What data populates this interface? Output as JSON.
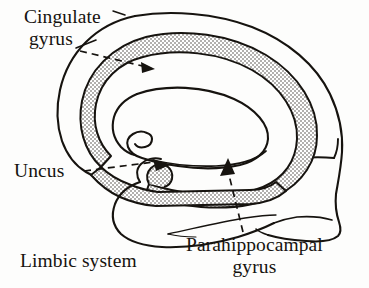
{
  "figure": {
    "title": "Limbic system",
    "background_color": "#fdfdfc",
    "ink_color": "#16130f",
    "stipple_color": "#4a4540"
  },
  "labels": {
    "cingulate": {
      "line1": "Cingulate",
      "line2": "gyrus"
    },
    "uncus": {
      "line1": "Uncus"
    },
    "parahippocampal": {
      "line1": "Parahippocampal",
      "line2": "gyrus"
    },
    "caption": {
      "line1": "Limbic system"
    }
  },
  "annotations": [
    {
      "name": "cingulate-gyrus-leader",
      "label": "Cingulate gyrus",
      "style": "dashed-with-arrowhead",
      "points_to": "upper stippled band"
    },
    {
      "name": "uncus-leader",
      "label": "Uncus",
      "style": "dashed-with-arrowhead",
      "points_to": "hook at anterior end of lower stippled band"
    },
    {
      "name": "parahippocampal-gyrus-leader",
      "label": "Parahippocampal gyrus",
      "style": "dashed-with-arrowhead",
      "points_to": "lower stippled band"
    }
  ],
  "regions": [
    {
      "name": "cerebral-outline",
      "fill": "none",
      "stroke": "#16130f"
    },
    {
      "name": "limbic-lobe-band",
      "fill": "stipple",
      "stroke": "#16130f"
    },
    {
      "name": "corpus-callosum",
      "fill": "none",
      "stroke": "#16130f"
    },
    {
      "name": "temporal-lobe",
      "fill": "none",
      "stroke": "#16130f"
    },
    {
      "name": "brainstem-cerebellum",
      "fill": "none",
      "stroke": "#16130f"
    }
  ]
}
